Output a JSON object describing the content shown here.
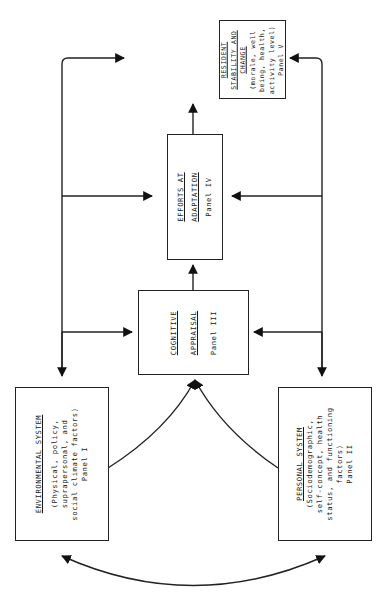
{
  "diagram": {
    "orientation": "rotated -90deg (page printed landscape)",
    "panels": [
      {
        "id": "panel-1",
        "title_lines": [
          "ENVIRONMENTAL SYSTEM"
        ],
        "description_lines": [
          "(Physical, policy,",
          "suprapersonal, and",
          "social climate factors)"
        ],
        "panel_label": "Panel I"
      },
      {
        "id": "panel-2",
        "title_lines": [
          "PERSONAL SYSTEM"
        ],
        "description_lines": [
          "(Sociodemographic,",
          "self-concept, health",
          "status, and functioning",
          "factors)"
        ],
        "panel_label": "Panel II"
      },
      {
        "id": "panel-3",
        "title_lines": [
          "COGNITIVE",
          "APPRAISAL"
        ],
        "description_lines": [],
        "panel_label": "Panel III"
      },
      {
        "id": "panel-4",
        "title_lines": [
          "EFFORTS AT",
          "ADAPTATION"
        ],
        "description_lines": [],
        "panel_label": "Panel IV"
      },
      {
        "id": "panel-5",
        "title_lines": [
          "RESIDENT",
          "STABILITY AND",
          "CHANGE"
        ],
        "description_lines": [
          "(morale, well",
          "being, health,",
          "activity level)"
        ],
        "panel_label": "Panel V"
      }
    ],
    "edges": [
      {
        "from": "panel-1",
        "to": "panel-3",
        "style": "curved"
      },
      {
        "from": "panel-2",
        "to": "panel-3",
        "style": "curved"
      },
      {
        "from": "panel-1",
        "to": "panel-2",
        "style": "curved-bidirectional"
      },
      {
        "from": "panel-3",
        "to": "panel-4",
        "style": "straight"
      },
      {
        "from": "panel-4",
        "to": "panel-5",
        "style": "straight"
      },
      {
        "from": "panel-1",
        "to": [
          "panel-3",
          "panel-4",
          "panel-5"
        ],
        "style": "feedback-bus-left"
      },
      {
        "from": "panel-2",
        "to": [
          "panel-3",
          "panel-4",
          "panel-5"
        ],
        "style": "feedback-bus-right"
      }
    ]
  }
}
